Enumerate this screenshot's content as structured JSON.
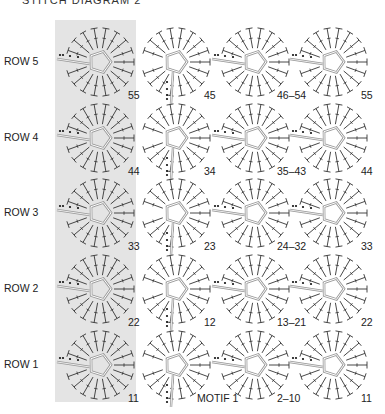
{
  "title": "STITCH DIAGRAM 2",
  "shaded_column_color": "#e4e4e4",
  "rows": [
    {
      "label": "ROW 5",
      "y": 62,
      "numbers": [
        "55",
        "45",
        "46–54",
        "55"
      ]
    },
    {
      "label": "ROW 4",
      "y": 138,
      "numbers": [
        "44",
        "34",
        "35–43",
        "44"
      ]
    },
    {
      "label": "ROW 3",
      "y": 213,
      "numbers": [
        "33",
        "23",
        "24–32",
        "33"
      ]
    },
    {
      "label": "ROW 2",
      "y": 289,
      "numbers": [
        "22",
        "12",
        "13–21",
        "22"
      ]
    },
    {
      "label": "ROW 1",
      "y": 365,
      "numbers": [
        "11",
        "",
        "2–10",
        "11"
      ]
    }
  ],
  "motif_1_label": "MOTIF 1",
  "column_x": [
    100,
    176,
    255,
    333
  ]
}
